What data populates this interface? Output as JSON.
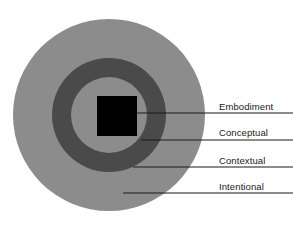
{
  "diagram": {
    "type": "concentric-circles",
    "title": "",
    "background_color": "#ffffff",
    "center": {
      "x": 109,
      "y": 115
    },
    "layers": [
      {
        "id": "intentional",
        "label": "Intentional",
        "shape": "circle",
        "radius": 96,
        "fill": "#8c8c8c",
        "level": 4,
        "leader_line": {
          "x1": 123,
          "y1": 193,
          "x2": 293,
          "y2": 193
        }
      },
      {
        "id": "contextual",
        "label": "Contextual",
        "shape": "circle",
        "radius": 57,
        "fill": "#4a4a4a",
        "level": 3,
        "leader_line": {
          "x1": 133,
          "y1": 167,
          "x2": 293,
          "y2": 167
        }
      },
      {
        "id": "conceptual",
        "label": "Conceptual",
        "shape": "circle",
        "radius": 38,
        "fill": "#8c8c8c",
        "level": 2,
        "leader_line": {
          "x1": 141,
          "y1": 140,
          "x2": 293,
          "y2": 140
        }
      },
      {
        "id": "embodiment",
        "label": "Embodiment",
        "shape": "square",
        "size": 40,
        "x": 97,
        "y": 96,
        "fill": "#000000",
        "level": 1,
        "leader_line": {
          "x1": 137,
          "y1": 113,
          "x2": 293,
          "y2": 113
        }
      }
    ],
    "leader_line_color": "#1a1a1a",
    "label_color": "#1a1a1a"
  }
}
